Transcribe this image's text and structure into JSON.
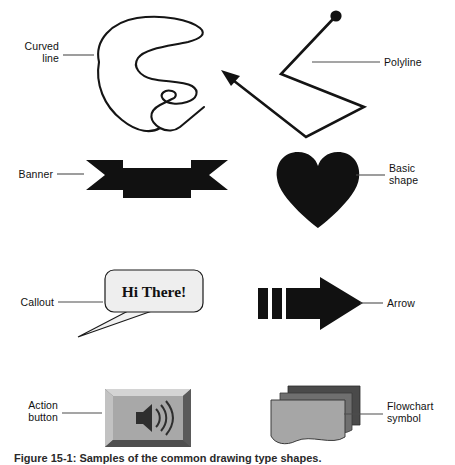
{
  "figure": {
    "caption": "Figure 15-1: Samples of the common drawing type shapes.",
    "background_color": "#ffffff",
    "ink_color": "#000000",
    "leader_color": "#4d4d4d"
  },
  "labels": [
    {
      "id": "curved-line",
      "text": "Curved\nline",
      "align": "right"
    },
    {
      "id": "polyline",
      "text": "Polyline",
      "align": "left"
    },
    {
      "id": "banner",
      "text": "Banner",
      "align": "right"
    },
    {
      "id": "basic-shape",
      "text": "Basic\nshape",
      "align": "left"
    },
    {
      "id": "callout",
      "text": "Callout",
      "align": "right"
    },
    {
      "id": "arrow",
      "text": "Arrow",
      "align": "left"
    },
    {
      "id": "action-button",
      "text": "Action\nbutton",
      "align": "right"
    },
    {
      "id": "flowchart-symbol",
      "text": "Flowchart\nsymbol",
      "align": "left"
    }
  ],
  "shapes": {
    "curved_line": {
      "name": "freeform-spiral-curve",
      "style": "outline",
      "stroke": "#151515"
    },
    "polyline": {
      "name": "zigzag-polyline-with-arrowhead",
      "style": "outline",
      "stroke": "#151515"
    },
    "banner": {
      "name": "ribbon-banner",
      "style": "filled",
      "fill": "#111111"
    },
    "basic_shape": {
      "name": "heart",
      "style": "filled",
      "fill": "#111111"
    },
    "callout": {
      "name": "rounded-speech-bubble",
      "style": "filled-outline",
      "fill": "#eeeeee",
      "stroke": "#1a1a1a",
      "text": "Hi There!"
    },
    "arrow": {
      "name": "striped-right-arrow",
      "style": "filled",
      "fill": "#111111"
    },
    "action_button": {
      "name": "beveled-sound-button",
      "style": "beveled",
      "face": "#a8a8a8",
      "icon": "speaker-icon"
    },
    "flowchart_symbol": {
      "name": "stacked-multidocument",
      "style": "layered",
      "back": "#4a4a4a",
      "mid": "#6f6f6f",
      "front": "#a6a6a6"
    }
  }
}
